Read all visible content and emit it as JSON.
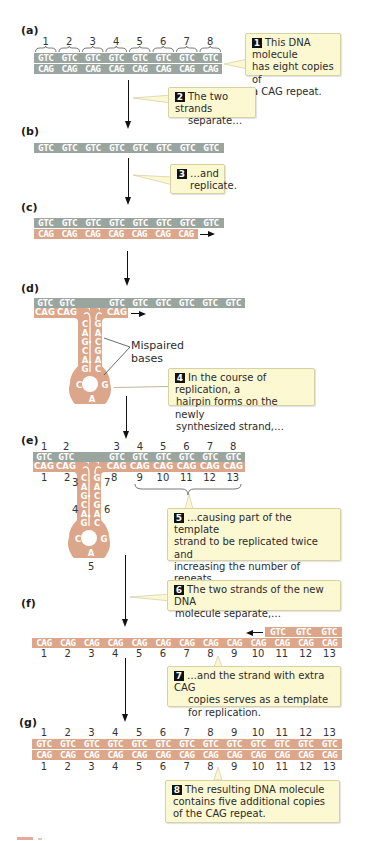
{
  "colors": {
    "template_strand": "#9aa59f",
    "new_strand": "#dca68a",
    "callout_bg": "#fbf8d2",
    "callout_border": "#d6d2a6",
    "badge": "#111111",
    "arrow": "#111111"
  },
  "panels": {
    "a": {
      "label": "(a)",
      "top_numbers": [
        "1",
        "2",
        "3",
        "4",
        "5",
        "6",
        "7",
        "8"
      ],
      "top_strand": [
        "GTC",
        "GTC",
        "GTC",
        "GTC",
        "GTC",
        "GTC",
        "GTC",
        "GTC"
      ],
      "bottom_strand": [
        "CAG",
        "CAG",
        "CAG",
        "CAG",
        "CAG",
        "CAG",
        "CAG",
        "CAG"
      ]
    },
    "b": {
      "label": "(b)",
      "strand": [
        "GTC",
        "GTC",
        "GTC",
        "GTC",
        "GTC",
        "GTC",
        "GTC",
        "GTC"
      ]
    },
    "c": {
      "label": "(c)",
      "top_strand": [
        "GTC",
        "GTC",
        "GTC",
        "GTC",
        "GTC",
        "GTC",
        "GTC",
        "GTC"
      ],
      "bottom_strand": [
        "CAG",
        "CAG",
        "CAG",
        "CAG",
        "CAG",
        "CAG",
        "CAG"
      ]
    },
    "d": {
      "label": "(d)",
      "top_left": [
        "GTC",
        "GTC"
      ],
      "top_right": [
        "GTC",
        "GTC",
        "GTC",
        "GTC",
        "GTC",
        "GTC"
      ],
      "bottom_left": [
        "CAG",
        "CAG"
      ],
      "bottom_right": [
        "CAG"
      ],
      "hairpin_left": [
        "C",
        "A",
        "G",
        "C",
        "A",
        "G"
      ],
      "hairpin_right": [
        "G",
        "A",
        "C",
        "G",
        "A",
        "C"
      ],
      "loop": [
        "C",
        "A",
        "G"
      ],
      "mispaired_label_1": "Mispaired",
      "mispaired_label_2": "bases"
    },
    "e": {
      "label": "(e)",
      "top_numbers_left": [
        "1",
        "2"
      ],
      "top_numbers_right": [
        "3",
        "4",
        "5",
        "6",
        "7",
        "8"
      ],
      "top_left": [
        "GTC",
        "GTC"
      ],
      "top_right": [
        "GTC",
        "GTC",
        "GTC",
        "GTC",
        "GTC",
        "GTC"
      ],
      "bottom_left": [
        "CAG",
        "CAG"
      ],
      "bottom_right": [
        "CAG",
        "CAG",
        "CAG",
        "CAG",
        "CAG",
        "CAG"
      ],
      "bottom_numbers_left": [
        "1",
        "2"
      ],
      "bottom_numbers_right": [
        "8",
        "9",
        "10",
        "11",
        "12",
        "13"
      ],
      "hairpin_left": [
        "C",
        "A",
        "G",
        "C",
        "A",
        "G"
      ],
      "hairpin_right": [
        "G",
        "A",
        "C",
        "G",
        "A",
        "C"
      ],
      "loop": [
        "C",
        "A",
        "G"
      ],
      "hairpin_numbers": {
        "n3": "3",
        "n4": "4",
        "n5": "5",
        "n6": "6",
        "n7": "7"
      }
    },
    "f": {
      "label": "(f)",
      "top_strand": [
        "GTC",
        "GTC",
        "GTC"
      ],
      "bottom_strand": [
        "CAG",
        "CAG",
        "CAG",
        "CAG",
        "CAG",
        "CAG",
        "CAG",
        "CAG",
        "CAG",
        "CAG",
        "CAG",
        "CAG",
        "CAG"
      ],
      "bottom_numbers": [
        "1",
        "2",
        "3",
        "4",
        "5",
        "6",
        "7",
        "8",
        "9",
        "10",
        "11",
        "12",
        "13"
      ]
    },
    "g": {
      "label": "(g)",
      "top_numbers": [
        "1",
        "2",
        "3",
        "4",
        "5",
        "6",
        "7",
        "8",
        "9",
        "10",
        "11",
        "12",
        "13"
      ],
      "top_strand": [
        "GTC",
        "GTC",
        "GTC",
        "GTC",
        "GTC",
        "GTC",
        "GTC",
        "GTC",
        "GTC",
        "GTC",
        "GTC",
        "GTC",
        "GTC"
      ],
      "bottom_strand": [
        "CAG",
        "CAG",
        "CAG",
        "CAG",
        "CAG",
        "CAG",
        "CAG",
        "CAG",
        "CAG",
        "CAG",
        "CAG",
        "CAG",
        "CAG"
      ],
      "bottom_numbers": [
        "1",
        "2",
        "3",
        "4",
        "5",
        "6",
        "7",
        "8",
        "9",
        "10",
        "11",
        "12",
        "13"
      ]
    }
  },
  "callouts": [
    {
      "step": "1",
      "lines": [
        "This DNA molecule",
        "has eight copies of",
        "a CAG repeat."
      ]
    },
    {
      "step": "2",
      "lines": [
        "The two strands",
        "separate…"
      ]
    },
    {
      "step": "3",
      "lines": [
        "…and",
        "replicate."
      ]
    },
    {
      "step": "4",
      "lines": [
        "In the course of replication, a",
        "hairpin forms on the newly",
        "synthesized strand,…"
      ]
    },
    {
      "step": "5",
      "lines": [
        "…causing part of the template",
        "strand to be replicated twice and",
        "increasing the number of repeats",
        "on the newly synthesized strand."
      ]
    },
    {
      "step": "6",
      "lines": [
        "The two strands of the new DNA",
        "molecule separate,…"
      ]
    },
    {
      "step": "7",
      "lines": [
        "…and the strand with extra CAG",
        "copies serves as a template",
        "for replication."
      ]
    },
    {
      "step": "8",
      "lines": [
        "The resulting DNA molecule",
        "contains five additional copies",
        "of the CAG repeat."
      ]
    }
  ]
}
